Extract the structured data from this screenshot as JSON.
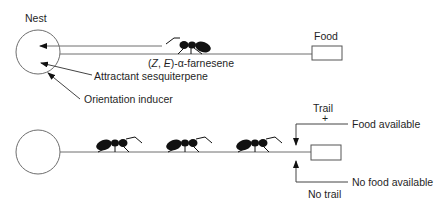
{
  "diagram": {
    "top_panel": {
      "nest_label": "Nest",
      "food_label": "Food",
      "pheromone_label_prefix": "(",
      "pheromone_label_z": "Z",
      "pheromone_label_sep": ", ",
      "pheromone_label_e": "E",
      "pheromone_label_suffix": ")-α-farnesene",
      "attractant_label": "Attractant sesquiterpene",
      "orientation_label": "Orientation inducer"
    },
    "bottom_panel": {
      "trail_label": "Trail",
      "plus_label": "+",
      "food_available_label": "Food available",
      "no_food_available_label": "No food available",
      "no_trail_label": "No trail"
    },
    "colors": {
      "line": "#6e6e6e",
      "ant": "#111111",
      "text": "#1f1f1f"
    }
  }
}
